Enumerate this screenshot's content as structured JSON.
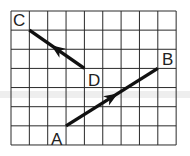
{
  "diagram": {
    "type": "grid-vectors",
    "grid": {
      "columns": 9,
      "rows": 7,
      "origin_px": [
        11,
        11
      ],
      "cell_w_px": 18.35,
      "cell_h_px": 19.14,
      "line_color": "#2a2a2a",
      "background": "#ffffff"
    },
    "points": {
      "A": {
        "label": "A",
        "grid": [
          3,
          6
        ]
      },
      "B": {
        "label": "B",
        "grid": [
          8,
          3
        ]
      },
      "C": {
        "label": "C",
        "grid": [
          1,
          1
        ]
      },
      "D": {
        "label": "D",
        "grid": [
          4,
          3
        ]
      }
    },
    "vectors": [
      {
        "name": "AB",
        "from": "A",
        "to": "B",
        "displacement": [
          5,
          -3
        ],
        "arrow_position": "middle"
      },
      {
        "name": "DC",
        "from": "D",
        "to": "C",
        "displacement": [
          -3,
          -2
        ],
        "arrow_position": "middle"
      }
    ],
    "labels": {
      "A": "A",
      "B": "B",
      "C": "C",
      "D": "D"
    },
    "stroke_color": "#111111"
  }
}
